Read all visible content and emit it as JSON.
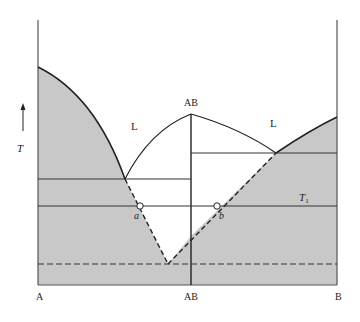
{
  "diagram": {
    "type": "binary phase diagram with congruently melting compound",
    "axis": {
      "temperature_label": "T",
      "composition_labels": [
        "A",
        "AB",
        "B"
      ]
    },
    "regions": {
      "liquid_left_label": "L",
      "liquid_right_label": "L"
    },
    "peak_label": "AB",
    "isotherm_label": "T",
    "isotherm_subscript": "1",
    "points": {
      "a_label": "a",
      "b_label": "b"
    },
    "colors": {
      "solid_fill": "#c8c8c8",
      "line": "#222222",
      "background": "#ffffff"
    }
  }
}
